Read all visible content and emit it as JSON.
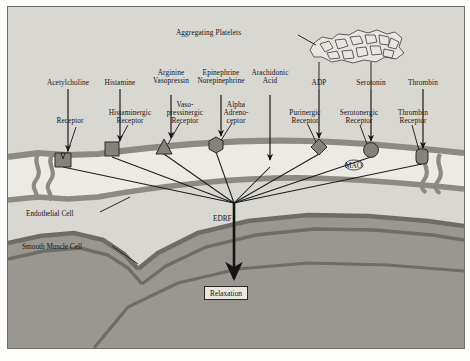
{
  "figure": {
    "background_color": "#d9d7d2",
    "lumen_color": "#eceae5",
    "membrane_color": "#8d8a84",
    "smooth_muscle_color": "#9a9792",
    "ink_color": "#141414"
  },
  "platelets": {
    "label": "Aggregating Platelets",
    "fill": "#e8e6e1",
    "stroke": "#3a3a3a"
  },
  "agonists": [
    {
      "label": "Acetylcholine",
      "x": 60,
      "line_to_x": 60
    },
    {
      "label": "Histamine",
      "x": 112,
      "line_to_x": 112
    },
    {
      "label": "Arginine\nVasopressin",
      "x": 163,
      "line_to_x": 163
    },
    {
      "label": "Epinephrine\nNorepinephrine",
      "x": 213,
      "line_to_x": 213
    },
    {
      "label": "Arachidonic\nAcid",
      "x": 262,
      "line_to_x": 262
    },
    {
      "label": "ADP",
      "x": 311,
      "line_to_x": 311
    },
    {
      "label": "Serotonin",
      "x": 363,
      "line_to_x": 363
    },
    {
      "label": "Thrombin",
      "x": 415,
      "line_to_x": 415
    }
  ],
  "receptors": [
    {
      "label": "Receptor",
      "shape": "notched-square",
      "x": 55,
      "y": 152
    },
    {
      "label": "Histaminergic\nReceptor",
      "shape": "square",
      "x": 104,
      "y": 142
    },
    {
      "label": "Vaso-\npressinergic\nReceptor",
      "shape": "triangle",
      "x": 156,
      "y": 139
    },
    {
      "label": "Alpha\nAdreno-\nceptor",
      "shape": "hexagon",
      "x": 208,
      "y": 137
    },
    {
      "label": "Purinergic\nReceptor",
      "shape": "diamond",
      "x": 311,
      "y": 139
    },
    {
      "label": "Serotonergic\nReceptor",
      "shape": "circle",
      "x": 363,
      "y": 142
    },
    {
      "label": "Thrombin\nReceptor",
      "shape": "rounded-rect",
      "x": 414,
      "y": 149
    }
  ],
  "enzyme": {
    "label": "MAO"
  },
  "cells": [
    {
      "label": "Endothelial Cell"
    },
    {
      "label": "Smooth Muscle Cell"
    }
  ],
  "mediator": {
    "label": "EDRF"
  },
  "outcome": {
    "label": "Relaxation"
  }
}
